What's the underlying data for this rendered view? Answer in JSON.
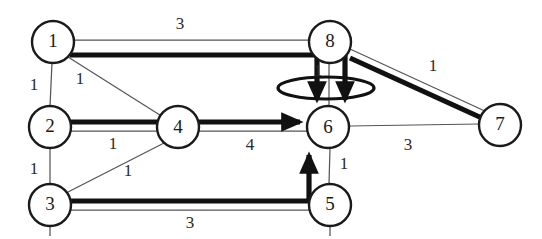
{
  "figure": {
    "background_color": "#ffffff",
    "width": 542,
    "height": 239
  },
  "style": {
    "node_fill": "#ffffff",
    "node_stroke": "#1a1a1a",
    "thin_edge_color": "#55555a",
    "thick_edge_color": "#111111",
    "label_color": "#2a2a2a"
  },
  "nodes": [
    {
      "id": "1",
      "label": "1",
      "cx": 53,
      "cy": 42,
      "r": 21
    },
    {
      "id": "2",
      "label": "2",
      "cx": 50,
      "cy": 127,
      "r": 21
    },
    {
      "id": "3",
      "label": "3",
      "cx": 50,
      "cy": 205,
      "r": 21
    },
    {
      "id": "4",
      "label": "4",
      "cx": 178,
      "cy": 127,
      "r": 21
    },
    {
      "id": "5",
      "label": "5",
      "cx": 330,
      "cy": 205,
      "r": 21
    },
    {
      "id": "6",
      "label": "6",
      "cx": 328,
      "cy": 127,
      "r": 21
    },
    {
      "id": "7",
      "label": "7",
      "cx": 500,
      "cy": 125,
      "r": 21
    },
    {
      "id": "8",
      "label": "8",
      "cx": 330,
      "cy": 42,
      "r": 21
    }
  ],
  "edges": [
    {
      "id": "e-1-8",
      "from": "1",
      "to": "8",
      "weight": "3",
      "weight_x": 180,
      "weight_y": 25,
      "emphasis": "thin"
    },
    {
      "id": "e-1-2",
      "from": "1",
      "to": "2",
      "weight": "1",
      "weight_x": 34,
      "weight_y": 86,
      "emphasis": "thin"
    },
    {
      "id": "e-1-4",
      "from": "1",
      "to": "4",
      "weight": "1",
      "weight_x": 80,
      "weight_y": 80,
      "emphasis": "thin"
    },
    {
      "id": "e-2-4",
      "from": "2",
      "to": "4",
      "weight": "1",
      "weight_x": 113,
      "weight_y": 145,
      "emphasis": "thin"
    },
    {
      "id": "e-2-3",
      "from": "2",
      "to": "3",
      "weight": "1",
      "weight_x": 34,
      "weight_y": 170,
      "emphasis": "thin"
    },
    {
      "id": "e-3-4",
      "from": "3",
      "to": "4",
      "weight": "1",
      "weight_x": 128,
      "weight_y": 172,
      "emphasis": "thin"
    },
    {
      "id": "e-3-5",
      "from": "3",
      "to": "5",
      "weight": "3",
      "weight_x": 190,
      "weight_y": 224,
      "emphasis": "thin"
    },
    {
      "id": "e-4-6",
      "from": "4",
      "to": "6",
      "weight": "4",
      "weight_x": 250,
      "weight_y": 146,
      "emphasis": "thick"
    },
    {
      "id": "e-8-6",
      "from": "8",
      "to": "6",
      "weight": "1",
      "weight_x": 318,
      "weight_y": 72,
      "emphasis": "thin"
    },
    {
      "id": "e-8-7",
      "from": "8",
      "to": "7",
      "weight": "1",
      "weight_x": 433,
      "weight_y": 67,
      "emphasis": "thick"
    },
    {
      "id": "e-6-7",
      "from": "6",
      "to": "7",
      "weight": "3",
      "weight_x": 408,
      "weight_y": 146,
      "emphasis": "thin"
    },
    {
      "id": "e-5-6",
      "from": "5",
      "to": "6",
      "weight": "1",
      "weight_x": 344,
      "weight_y": 165,
      "emphasis": "thin"
    }
  ],
  "loop": {
    "id": "self-loop-6",
    "cx": 326,
    "cy": 88,
    "rx": 48,
    "ry": 11
  },
  "path_highlight": {
    "description": "Bold highlighted route 1 -> 8 -> 6 and 2 -> 4 -> 6 and 3 -> 5 -> 6 and 8 -> 7",
    "arrow_targets": [
      "6"
    ]
  }
}
